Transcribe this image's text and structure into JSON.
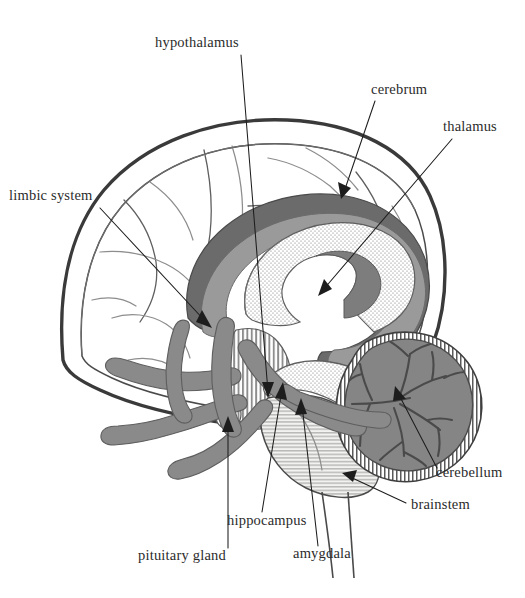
{
  "figure": {
    "background_color": "#ffffff",
    "width": 525,
    "height": 598,
    "style": "grayscale anatomical line illustration with stipple and hatch shading"
  },
  "palette": {
    "background": "#ffffff",
    "ink": "#1d1d1d",
    "outline_heavy": "#3a3a3a",
    "outline_medium": "#4a4a4a",
    "outline_thin": "#6e6e6e",
    "cortex_fill": "#e9e9e7",
    "cortex_inner_fill": "#f4f4f2",
    "limbic_dark_gray": "#6b6b6b",
    "limbic_mid_gray": "#9a9a9a",
    "thalamus_stipple": "#ffffff",
    "vessel_gray": "#8a8a8a",
    "cerebellum_gray": "#858585",
    "brainstem_hatch": "#d8d8d6",
    "label_text": "#2b2b2b"
  },
  "labels": [
    {
      "id": "hypothalamus",
      "text": "hypothalamus",
      "text_x": 155,
      "text_y": 47,
      "anchor": "start",
      "leader": "M 241 55 L 268 392",
      "arrow_x": 268,
      "arrow_y": 396,
      "arrow_angle": 94,
      "has_arrowhead": true,
      "description": "points down to the hypothalamic region beneath the thalamus"
    },
    {
      "id": "limbic-system",
      "text": "limbic system",
      "text_x": 9,
      "text_y": 200,
      "anchor": "start",
      "leader": "M 100 208 L 206 322",
      "arrow_x": 210,
      "arrow_y": 326,
      "arrow_angle": 47,
      "has_arrowhead": true,
      "description": "points to the dark gray limbic ring / cingulate gyrus"
    },
    {
      "id": "cerebrum",
      "text": "cerebrum",
      "text_x": 371,
      "text_y": 94,
      "anchor": "start",
      "leader": "M 375 101 L 344 192",
      "arrow_x": 341,
      "arrow_y": 196,
      "arrow_angle": 109,
      "has_arrowhead": true,
      "description": "points to the cerebral cortex surface"
    },
    {
      "id": "thalamus",
      "text": "thalamus",
      "text_x": 443,
      "text_y": 131,
      "anchor": "start",
      "leader": "M 452 139 L 323 290",
      "arrow_x": 319,
      "arrow_y": 294,
      "arrow_angle": 131,
      "has_arrowhead": true,
      "description": "points to the pale stippled thalamic mass at the brain core"
    },
    {
      "id": "cerebellum",
      "text": "cerebellum",
      "text_x": 436,
      "text_y": 477,
      "anchor": "start",
      "leader": "M 437 468 L 398 393",
      "arrow_x": 396,
      "arrow_y": 389,
      "arrow_angle": 242,
      "has_arrowhead": true,
      "description": "points into the cerebellum body showing arbor vitae"
    },
    {
      "id": "brainstem",
      "text": "brainstem",
      "text_x": 411,
      "text_y": 509,
      "anchor": "start",
      "leader": "M 406 503 L 348 476",
      "arrow_x": 344,
      "arrow_y": 474,
      "arrow_angle": 205,
      "has_arrowhead": true,
      "description": "points to the hatched brainstem below the cerebrum"
    },
    {
      "id": "pituitary-gland",
      "text": "pituitary gland",
      "text_x": 138,
      "text_y": 560,
      "anchor": "start",
      "leader": "M 228 548 L 228 422",
      "arrow_x": 228,
      "arrow_y": 418,
      "arrow_angle": 270,
      "has_arrowhead": true,
      "description": "points up to the small pituitary body below the hypothalamus"
    },
    {
      "id": "hippocampus",
      "text": "hippocampus",
      "text_x": 227,
      "text_y": 525,
      "anchor": "start",
      "leader": "M 262 512 L 282 389",
      "arrow_x": 283,
      "arrow_y": 385,
      "arrow_angle": 279,
      "has_arrowhead": true,
      "description": "points up to the hippocampal arc in the medial temporal lobe"
    },
    {
      "id": "amygdala",
      "text": "amygdala",
      "text_x": 293,
      "text_y": 558,
      "anchor": "start",
      "leader": "M 318 546 L 302 405",
      "arrow_x": 301,
      "arrow_y": 401,
      "arrow_angle": 264,
      "has_arrowhead": true,
      "description": "points up to the amygdala nucleus anterior to the hippocampus"
    }
  ],
  "structures": [
    {
      "id": "cerebrum",
      "name": "cerebrum",
      "shading": "light gray fill with curved sulci lines"
    },
    {
      "id": "limbic-ring",
      "name": "limbic system",
      "shading": "dark gray C-shaped band"
    },
    {
      "id": "corpus-band",
      "name": "inner limbic band",
      "shading": "medium gray band"
    },
    {
      "id": "thalamus",
      "name": "thalamus",
      "shading": "white with fine dot stipple"
    },
    {
      "id": "hypothalamus",
      "name": "hypothalamus",
      "shading": "vertical line hatch"
    },
    {
      "id": "pituitary-gland",
      "name": "pituitary gland",
      "shading": "vertical line hatch, small oval"
    },
    {
      "id": "hippocampus",
      "name": "hippocampus",
      "shading": "stippled elongated body"
    },
    {
      "id": "amygdala",
      "name": "amygdala",
      "shading": "solid medium gray mass"
    },
    {
      "id": "brainstem",
      "name": "brainstem",
      "shading": "horizontal line hatch"
    },
    {
      "id": "cerebellum",
      "name": "cerebellum",
      "shading": "gray body with branching arbor vitae and hatched rim"
    },
    {
      "id": "cranial-nerves",
      "name": "cranial nerves",
      "shading": "rounded medium gray tubes"
    }
  ]
}
